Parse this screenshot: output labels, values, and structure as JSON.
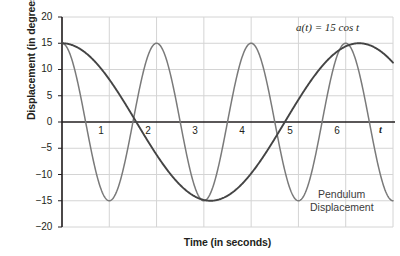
{
  "chart_data": {
    "type": "line",
    "title": "",
    "xlabel": "Time (in seconds)",
    "ylabel": "Displacement (in degrees)",
    "xlim": [
      0,
      7
    ],
    "ylim": [
      -20,
      20
    ],
    "grid": true,
    "x_ticks": [
      "1",
      "2",
      "3",
      "4",
      "5",
      "6"
    ],
    "x_tick_values": [
      1,
      2,
      3,
      4,
      5,
      6
    ],
    "x_axis_variable": "t",
    "y_ticks": [
      "20",
      "15",
      "10",
      "5",
      "0",
      "−5",
      "−10",
      "−15",
      "−20"
    ],
    "y_tick_values": [
      20,
      15,
      10,
      5,
      0,
      -5,
      -10,
      -15,
      -20
    ],
    "legend_position": "inline-annotations",
    "annotations": [
      {
        "name": "equation-label",
        "text": "a(t) = 15 cos t",
        "x": 6.0,
        "y": 17.0
      },
      {
        "name": "pendulum-label",
        "text": "Pendulum",
        "x": 5.6,
        "y": -12.0
      },
      {
        "name": "pendulum-label-2",
        "text": "Displacement",
        "x": 5.4,
        "y": -15.5
      }
    ],
    "series": [
      {
        "name": "Pendulum Displacement",
        "formula": "15 cos(pi t)",
        "amplitude": 15,
        "period": 2,
        "color": "#7a7a7a",
        "x": [
          0,
          0.5,
          1,
          1.5,
          2,
          2.5,
          3,
          3.5,
          4,
          4.5,
          5,
          5.5,
          6,
          6.5,
          7
        ],
        "values": [
          15,
          0,
          -15,
          0,
          15,
          0,
          -15,
          0,
          15,
          0,
          -15,
          0,
          15,
          0,
          -15
        ]
      },
      {
        "name": "a(t) = 15 cos t",
        "formula": "15 cos(t)",
        "amplitude": 15,
        "period": 6.283,
        "color": "#444444",
        "x": [
          0,
          0.785,
          1.571,
          2.356,
          3.142,
          3.927,
          4.712,
          5.498,
          6.283,
          7
        ],
        "values": [
          15,
          10.6,
          0,
          -10.6,
          -15,
          -10.6,
          0,
          10.6,
          15,
          11.3
        ]
      }
    ]
  },
  "colors": {
    "axis": "#231f20",
    "grid": "#d4d4d4",
    "series_light": "#7a7a7a",
    "series_dark": "#444444",
    "text": "#231f20"
  }
}
